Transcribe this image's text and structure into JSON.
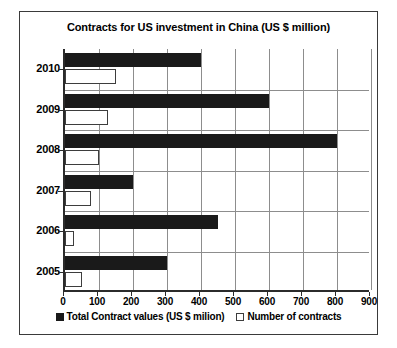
{
  "chart_data": {
    "type": "bar",
    "orientation": "horizontal",
    "title": "Contracts for US investment in China (US $ million)",
    "xlabel": "",
    "ylabel": "",
    "categories": [
      "2005",
      "2006",
      "2007",
      "2008",
      "2009",
      "2010"
    ],
    "series": [
      {
        "name": "Total Contract values (US $ milion)",
        "style": "filled-black",
        "values": [
          300,
          450,
          200,
          800,
          600,
          400
        ]
      },
      {
        "name": "Number of contracts",
        "style": "hollow-white",
        "values": [
          50,
          25,
          75,
          100,
          125,
          150
        ]
      }
    ],
    "xlim": [
      0,
      900
    ],
    "xticks": [
      0,
      100,
      200,
      300,
      400,
      500,
      600,
      700,
      800,
      900
    ],
    "xtick_labels": [
      "0",
      "100",
      "200",
      "300",
      "400",
      "500",
      "600",
      "700",
      "800",
      "900"
    ],
    "grid": true,
    "grid_axis": "x",
    "legend_position": "bottom",
    "colors": {
      "series_1": "#1a1a1a",
      "series_2": "#ffffff",
      "series_2_border": "#3d3d3d",
      "gridline": "#8d8d8d",
      "axis": "#2b2b2b",
      "frame": "#3a3a3a",
      "background": "#ffffff"
    }
  },
  "legend": {
    "items": [
      {
        "label": "Total Contract values (US $ milion)"
      },
      {
        "label": "Number of contracts"
      }
    ]
  }
}
